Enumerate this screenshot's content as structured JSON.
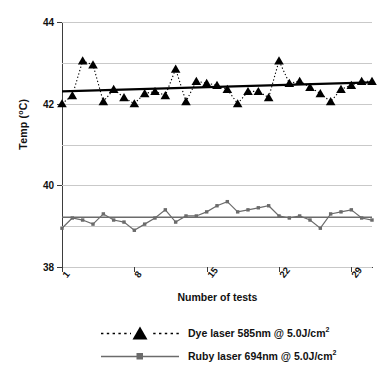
{
  "chart_data": {
    "type": "line",
    "title": "",
    "xlabel": "Number of tests",
    "ylabel": "Temp (°C)",
    "ylim": [
      38,
      44
    ],
    "ytick_labels": [
      "38",
      "40",
      "42",
      "44"
    ],
    "ytick_values": [
      38,
      40,
      42,
      44
    ],
    "gridlines_y": [
      38,
      39,
      40,
      41,
      42,
      43,
      44
    ],
    "grid": true,
    "xlim": [
      1,
      31
    ],
    "xtick_labels": [
      "1",
      "8",
      "15",
      "22",
      "29"
    ],
    "xtick_values": [
      1,
      8,
      15,
      22,
      29
    ],
    "legend_position": "below",
    "x": [
      1,
      2,
      3,
      4,
      5,
      6,
      7,
      8,
      9,
      10,
      11,
      12,
      13,
      14,
      15,
      16,
      17,
      18,
      19,
      20,
      21,
      22,
      23,
      24,
      25,
      26,
      27,
      28,
      29,
      30,
      31
    ],
    "series": [
      {
        "name": "Dye laser 585nm @ 5.0J/cm²",
        "marker": "triangle",
        "linestyle": "dotted",
        "color": "#000000",
        "values": [
          42.0,
          42.2,
          43.05,
          42.95,
          42.05,
          42.35,
          42.15,
          42.0,
          42.25,
          42.3,
          42.2,
          42.85,
          42.05,
          42.55,
          42.5,
          42.45,
          42.35,
          42.0,
          42.3,
          42.3,
          42.15,
          43.05,
          42.5,
          42.55,
          42.4,
          42.25,
          42.05,
          42.35,
          42.45,
          42.55,
          42.55
        ],
        "trendline": {
          "start": 42.3,
          "end": 42.52,
          "color": "#000000",
          "width": 2.2
        }
      },
      {
        "name": "Ruby laser 694nm @ 5.0J/cm²",
        "marker": "square",
        "linestyle": "solid",
        "color": "#6b6b6b",
        "values": [
          38.95,
          39.2,
          39.15,
          39.05,
          39.3,
          39.15,
          39.1,
          38.9,
          39.05,
          39.2,
          39.4,
          39.1,
          39.25,
          39.25,
          39.35,
          39.5,
          39.6,
          39.35,
          39.4,
          39.45,
          39.5,
          39.25,
          39.2,
          39.25,
          39.15,
          38.95,
          39.3,
          39.35,
          39.4,
          39.2,
          39.15
        ],
        "trendline": {
          "start": 39.22,
          "end": 39.22,
          "color": "#6b6b6b",
          "width": 1.4
        }
      }
    ]
  },
  "axis": {
    "y_title_main": "Temp (",
    "y_title_unit": "o",
    "y_title_tail": "C)",
    "x_title": "Number of tests"
  },
  "legend": {
    "entries": [
      {
        "label_main": "Dye laser 585nm @ 5.0J/cm",
        "label_sup": "2",
        "marker": "triangle-icon",
        "line": "dotted"
      },
      {
        "label_main": "Ruby laser 694nm @ 5.0J/cm",
        "label_sup": "2",
        "marker": "square-icon",
        "line": "solid"
      }
    ]
  }
}
